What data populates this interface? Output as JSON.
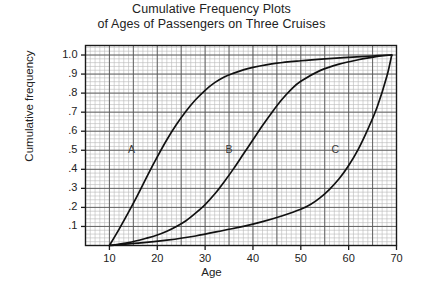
{
  "chart_data": {
    "type": "line",
    "title": "Cumulative Frequency Plots of Ages of Passengers on Three Cruises",
    "title_lines": [
      "Cumulative Frequency Plots",
      "of Ages of Passengers on Three Cruises"
    ],
    "xlabel": "Age",
    "ylabel": "Cumulative frequency",
    "xlim": [
      5,
      70
    ],
    "ylim": [
      0,
      1.05
    ],
    "grid": true,
    "grid_minor_step_x": 1,
    "grid_minor_step_y": 0.02,
    "grid_major_step_x": 5,
    "grid_major_step_y": 0.1,
    "legend": "inline curve labels",
    "xticks": [
      10,
      20,
      30,
      40,
      50,
      60,
      70
    ],
    "xtick_labels": [
      "10",
      "20",
      "30",
      "40",
      "50",
      "60",
      "70"
    ],
    "yticks": [
      0.1,
      0.2,
      0.3,
      0.4,
      0.5,
      0.6,
      0.7,
      0.8,
      0.9,
      1.0
    ],
    "ytick_labels": [
      ".1",
      ".2",
      ".3",
      ".4",
      ".5",
      ".6",
      ".7",
      ".8",
      ".9",
      "1.0"
    ],
    "series": [
      {
        "name": "A",
        "label": "A",
        "label_x": 14.6,
        "label_y": 0.5,
        "color": "#111111",
        "x": [
          10,
          12,
          14,
          16,
          18,
          20,
          22,
          24,
          26,
          28,
          30,
          32,
          34,
          36,
          38,
          40,
          45,
          50,
          55,
          60,
          65,
          69
        ],
        "values": [
          0.0,
          0.085,
          0.175,
          0.27,
          0.37,
          0.465,
          0.555,
          0.635,
          0.705,
          0.765,
          0.815,
          0.855,
          0.885,
          0.905,
          0.922,
          0.935,
          0.957,
          0.97,
          0.98,
          0.988,
          0.995,
          1.0
        ]
      },
      {
        "name": "B",
        "label": "B",
        "label_x": 35.0,
        "label_y": 0.5,
        "color": "#111111",
        "x": [
          10,
          14,
          18,
          20,
          22,
          24,
          26,
          28,
          30,
          32,
          34,
          36,
          38,
          40,
          42,
          44,
          46,
          48,
          50,
          54,
          58,
          62,
          66,
          69
        ],
        "values": [
          0.0,
          0.015,
          0.04,
          0.055,
          0.075,
          0.1,
          0.13,
          0.17,
          0.215,
          0.27,
          0.335,
          0.405,
          0.48,
          0.555,
          0.63,
          0.7,
          0.765,
          0.82,
          0.862,
          0.918,
          0.952,
          0.975,
          0.993,
          1.0
        ]
      },
      {
        "name": "C",
        "label": "C",
        "label_x": 57.2,
        "label_y": 0.5,
        "color": "#111111",
        "x": [
          10,
          16,
          22,
          28,
          34,
          38,
          42,
          46,
          50,
          52,
          54,
          56,
          58,
          60,
          62,
          64,
          66,
          68,
          69
        ],
        "values": [
          0.0,
          0.012,
          0.028,
          0.05,
          0.08,
          0.1,
          0.125,
          0.155,
          0.19,
          0.215,
          0.25,
          0.295,
          0.35,
          0.42,
          0.505,
          0.61,
          0.73,
          0.89,
          1.0
        ]
      }
    ]
  }
}
